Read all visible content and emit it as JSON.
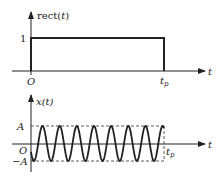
{
  "panels": [
    {
      "name": "rect-pulse",
      "ylabel_prefix": "rect(",
      "ylabel_var": "t",
      "ylabel_suffix": ")",
      "level_label": "1",
      "origin_label": "O",
      "xaxis_label": "t",
      "end_label_main": "t",
      "end_label_sub": "p"
    },
    {
      "name": "sinusoid-burst",
      "ylabel": "x(t)",
      "amp_label": "A",
      "neg_amp_label": "−A",
      "origin_label": "O",
      "xaxis_label": "t",
      "end_label_main": "t",
      "end_label_sub": "p"
    }
  ],
  "chart_data": [
    {
      "type": "line",
      "title": "rect(t)",
      "xlabel": "t",
      "ylabel": "rect(t)",
      "x": [
        "0",
        "t_p"
      ],
      "series": [
        {
          "name": "rect(t)",
          "values": [
            1,
            1
          ]
        }
      ],
      "ylim": [
        0,
        1
      ],
      "annotations": [
        "O",
        "1",
        "t_p"
      ]
    },
    {
      "type": "line",
      "title": "x(t)",
      "xlabel": "t",
      "ylabel": "x(t)",
      "description": "Sinusoid of amplitude A over 0 ≤ t ≤ t_p (~7.75 cycles), dashed envelope lines at ±A",
      "cycles": 7.75,
      "ylim": [
        "-A",
        "A"
      ],
      "annotations": [
        "A",
        "-A",
        "O",
        "t_p"
      ]
    }
  ]
}
